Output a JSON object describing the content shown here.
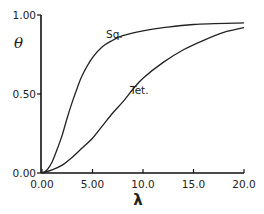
{
  "chart_data": {
    "type": "line",
    "title": "",
    "xlabel": "λ",
    "ylabel": "θ",
    "xlim": [
      0,
      20
    ],
    "ylim": [
      0,
      1
    ],
    "grid": false,
    "legend": "inline labels on curves",
    "x_ticks": [
      "0.00",
      "5.00",
      "10.0",
      "15.0",
      "20.0"
    ],
    "y_ticks": [
      "0.00",
      "0.50",
      "1.00"
    ],
    "series": [
      {
        "name": "Sq.",
        "x": [
          0,
          0.5,
          1,
          1.5,
          2,
          2.5,
          3,
          3.5,
          4,
          5,
          6,
          7,
          8,
          10,
          12,
          15,
          20
        ],
        "values": [
          0,
          0.02,
          0.07,
          0.15,
          0.24,
          0.35,
          0.45,
          0.54,
          0.62,
          0.73,
          0.8,
          0.84,
          0.87,
          0.9,
          0.92,
          0.94,
          0.95
        ]
      },
      {
        "name": "Tet.",
        "x": [
          0,
          1,
          2,
          3,
          4,
          5,
          6,
          7,
          8,
          9,
          10,
          12,
          14,
          16,
          18,
          20
        ],
        "values": [
          0,
          0.02,
          0.05,
          0.1,
          0.16,
          0.22,
          0.3,
          0.38,
          0.45,
          0.53,
          0.6,
          0.7,
          0.78,
          0.84,
          0.89,
          0.92
        ]
      }
    ]
  },
  "labels": {
    "ylabel": "θ",
    "xlabel": "λ",
    "sq": "Sq.",
    "tet": "Tet."
  }
}
